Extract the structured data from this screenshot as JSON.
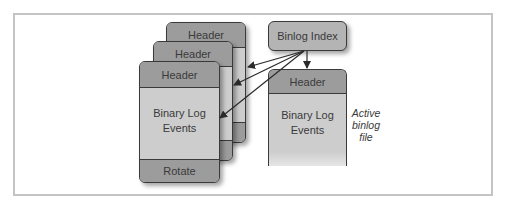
{
  "diagram": {
    "type": "binary-log-structure",
    "binlog_files": [
      {
        "header": "Header",
        "footer": "Rotate"
      },
      {
        "header": "Header",
        "footer": "Rotate"
      },
      {
        "header": "Header",
        "body": [
          "Binary Log",
          "Events"
        ],
        "footer": "Rotate"
      }
    ],
    "index": {
      "label": "Binlog Index"
    },
    "active_file": {
      "header": "Header",
      "body": [
        "Binary Log",
        "Events"
      ],
      "note": [
        "Active",
        "binlog",
        "file"
      ]
    },
    "edges": [
      {
        "from": "Binlog Index",
        "to": "binlog file 1 (back)"
      },
      {
        "from": "Binlog Index",
        "to": "binlog file 2 (middle)"
      },
      {
        "from": "Binlog Index",
        "to": "binlog file 3 (front)"
      },
      {
        "from": "Binlog Index",
        "to": "Active binlog file"
      }
    ],
    "colors": {
      "header": "#9c9c9c",
      "body": "#cdcdcd",
      "index": "#b4b4b4",
      "border": "#3a3a3a",
      "frame": "#c4c4c4"
    }
  }
}
